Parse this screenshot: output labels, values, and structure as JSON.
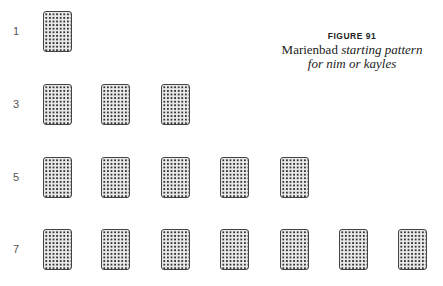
{
  "figure": {
    "number": "FIGURE 91",
    "title_upright": "Marienbad ",
    "title_italic_1": "starting pattern",
    "title_italic_2": "for nim or kayles"
  },
  "rows": [
    {
      "label": "1",
      "count": 1,
      "top": 11
    },
    {
      "label": "3",
      "count": 3,
      "top": 84
    },
    {
      "label": "5",
      "count": 5,
      "top": 157
    },
    {
      "label": "7",
      "count": 7,
      "top": 229
    }
  ],
  "card_columns_x": [
    43,
    101,
    161,
    220,
    280,
    339,
    398
  ]
}
